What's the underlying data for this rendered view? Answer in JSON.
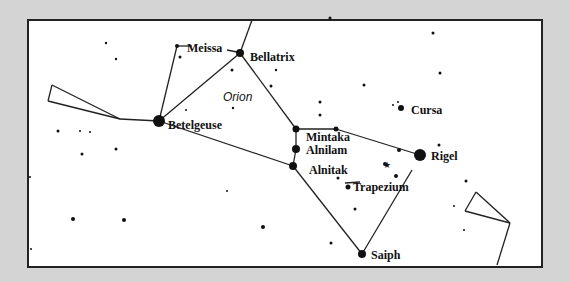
{
  "diagram": {
    "title": "Orion",
    "colors": {
      "background": "#d4d4d4",
      "panel": "#ffffff",
      "ink": "#111111"
    },
    "frame": {
      "x": 28,
      "y": 20,
      "w": 514,
      "h": 247
    },
    "constellation_label": {
      "text": "Orion",
      "x": 223,
      "y": 91
    },
    "named_stars": [
      {
        "name": "Betelgeuse",
        "x": 159,
        "y": 121,
        "r": 6,
        "label_x": 168,
        "label_y": 119
      },
      {
        "name": "Bellatrix",
        "x": 240,
        "y": 53,
        "r": 4,
        "label_x": 250,
        "label_y": 51
      },
      {
        "name": "Meissa",
        "x": 177,
        "y": 46,
        "r": 2,
        "label_x": 187,
        "label_y": 42
      },
      {
        "name": "Mintaka",
        "x": 296,
        "y": 129,
        "r": 3.5,
        "label_x": 306,
        "label_y": 131
      },
      {
        "name": "Alnilam",
        "x": 296,
        "y": 149,
        "r": 4,
        "label_x": 306,
        "label_y": 144
      },
      {
        "name": "Alnitak",
        "x": 293,
        "y": 166,
        "r": 4,
        "label_x": 309,
        "label_y": 164
      },
      {
        "name": "Rigel",
        "x": 420,
        "y": 155,
        "r": 6,
        "label_x": 431,
        "label_y": 150
      },
      {
        "name": "Saiph",
        "x": 362,
        "y": 254,
        "r": 4,
        "label_x": 371,
        "label_y": 249
      },
      {
        "name": "Cursa",
        "x": 401,
        "y": 108,
        "r": 3,
        "label_x": 411,
        "label_y": 104
      },
      {
        "name": "Trapezium",
        "x": 348,
        "y": 187,
        "r": 2.5,
        "label_x": 353,
        "label_y": 181
      }
    ],
    "lines": [
      [
        252,
        20,
        240,
        53
      ],
      [
        240,
        53,
        159,
        121
      ],
      [
        240,
        53,
        296,
        129
      ],
      [
        177,
        46,
        159,
        121
      ],
      [
        159,
        121,
        120,
        119
      ],
      [
        120,
        119,
        52,
        85
      ],
      [
        120,
        119,
        48,
        101
      ],
      [
        52,
        85,
        48,
        101
      ],
      [
        159,
        121,
        293,
        166
      ],
      [
        296,
        129,
        336,
        129
      ],
      [
        336,
        129,
        420,
        155
      ],
      [
        296,
        129,
        296,
        149
      ],
      [
        296,
        149,
        293,
        166
      ],
      [
        293,
        166,
        362,
        254
      ],
      [
        362,
        254,
        412,
        170
      ],
      [
        476,
        192,
        510,
        223
      ],
      [
        476,
        192,
        465,
        211
      ],
      [
        465,
        211,
        510,
        223
      ],
      [
        510,
        223,
        497,
        265
      ],
      [
        177,
        46,
        192,
        46
      ],
      [
        227,
        50,
        237,
        52
      ],
      [
        345,
        183,
        360,
        182
      ]
    ],
    "minor_stars": [
      [
        106,
        43,
        1.2
      ],
      [
        116,
        59,
        1.2
      ],
      [
        180,
        57,
        1.5
      ],
      [
        232,
        70,
        1.5
      ],
      [
        276,
        70,
        1.2
      ],
      [
        271,
        86,
        1.5
      ],
      [
        233,
        108,
        1.2
      ],
      [
        186,
        110,
        1
      ],
      [
        58,
        131,
        1.5
      ],
      [
        80,
        131,
        1
      ],
      [
        90,
        132,
        1
      ],
      [
        330,
        18,
        1.5
      ],
      [
        433,
        33,
        1.5
      ],
      [
        440,
        73,
        1.5
      ],
      [
        364,
        85,
        1.5
      ],
      [
        320,
        102,
        1.5
      ],
      [
        320,
        115,
        1.5
      ],
      [
        393,
        105,
        1
      ],
      [
        398,
        102,
        1
      ],
      [
        336,
        129,
        2.5
      ],
      [
        399,
        150,
        2
      ],
      [
        439,
        145,
        1.5
      ],
      [
        385,
        164,
        2
      ],
      [
        396,
        176,
        2
      ],
      [
        338,
        178,
        1.5
      ],
      [
        355,
        209,
        1.5
      ],
      [
        331,
        243,
        1.5
      ],
      [
        466,
        181,
        1.5
      ],
      [
        454,
        206,
        1
      ],
      [
        464,
        230,
        1
      ],
      [
        82,
        154,
        1.5
      ],
      [
        116,
        149,
        1.5
      ],
      [
        30,
        177,
        1
      ],
      [
        73,
        219,
        2
      ],
      [
        124,
        220,
        2
      ],
      [
        227,
        191,
        1
      ],
      [
        263,
        227,
        2
      ],
      [
        31,
        249,
        1
      ]
    ],
    "nebula_glyphs": [
      [
        387,
        165
      ]
    ]
  }
}
